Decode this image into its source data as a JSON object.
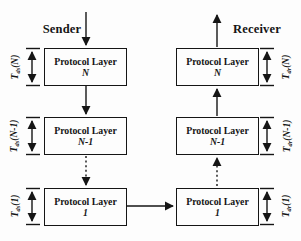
{
  "colors": {
    "background": "#fdfdfd",
    "ink": "#151515"
  },
  "sender": {
    "heading": "Sender",
    "layers": [
      {
        "name": "Protocol Layer",
        "id": "N",
        "delay": {
          "base": "T",
          "sub": "ds",
          "arg": "(N)"
        }
      },
      {
        "name": "Protocol Layer",
        "id": "N-1",
        "delay": {
          "base": "T",
          "sub": "ds",
          "arg": "(N-1)"
        }
      },
      {
        "name": "Protocol Layer",
        "id": "1",
        "delay": {
          "base": "T",
          "sub": "ds",
          "arg": "(1)"
        }
      }
    ]
  },
  "receiver": {
    "heading": "Receiver",
    "layers": [
      {
        "name": "Protocol Layer",
        "id": "N",
        "delay": {
          "base": "T",
          "sub": "dr",
          "arg": "(N)"
        }
      },
      {
        "name": "Protocol Layer",
        "id": "N-1",
        "delay": {
          "base": "T",
          "sub": "dr",
          "arg": "(N-1)"
        }
      },
      {
        "name": "Protocol Layer",
        "id": "1",
        "delay": {
          "base": "T",
          "sub": "dr",
          "arg": "(1)"
        }
      }
    ]
  }
}
